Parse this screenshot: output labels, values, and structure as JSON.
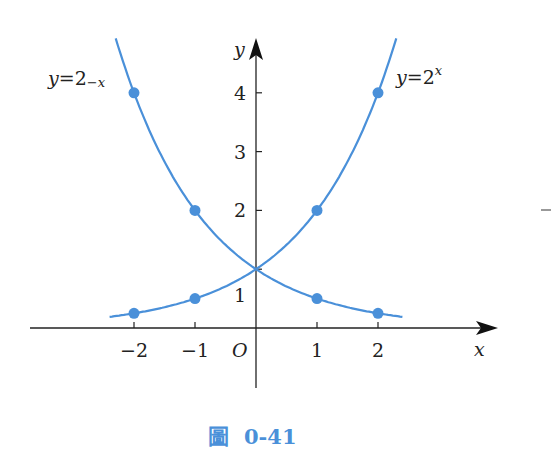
{
  "chart_data": {
    "type": "line",
    "title": "",
    "caption": "圖 0-41",
    "xlabel": "x",
    "ylabel": "y",
    "origin_label": "O",
    "x_ticks": [
      -2,
      -1,
      1,
      2
    ],
    "x_tick_labels": [
      "−2",
      "−1",
      "1",
      "2"
    ],
    "y_ticks": [
      1,
      2,
      3,
      4
    ],
    "y_tick_labels": [
      "1",
      "2",
      "3",
      "4"
    ],
    "xlim": [
      -3.7,
      3.9
    ],
    "ylim": [
      -1,
      4.9
    ],
    "grid": false,
    "series": [
      {
        "name": "y=2^-x",
        "label_text": "y=2",
        "label_exp": "−x",
        "color": "#4a90d9",
        "curve_range": [
          -2.3,
          2.4
        ],
        "points": [
          {
            "x": -2,
            "y": 4
          },
          {
            "x": -1,
            "y": 2
          },
          {
            "x": 1,
            "y": 0.5
          },
          {
            "x": 2,
            "y": 0.25
          }
        ]
      },
      {
        "name": "y=2^x",
        "label_text": "y=2",
        "label_exp": "x",
        "color": "#4a90d9",
        "curve_range": [
          -2.4,
          2.3
        ],
        "points": [
          {
            "x": -2,
            "y": 0.25
          },
          {
            "x": -1,
            "y": 0.5
          },
          {
            "x": 1,
            "y": 2
          },
          {
            "x": 2,
            "y": 4
          }
        ]
      }
    ],
    "intersection": {
      "x": 0,
      "y": 1
    }
  },
  "colors": {
    "curve": "#4a90d9",
    "axis": "#222222",
    "caption": "#4a90d9"
  },
  "caption": {
    "glyph": "圖",
    "number": "0-41"
  }
}
